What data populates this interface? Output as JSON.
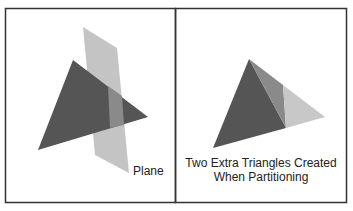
{
  "left_panel": {
    "label": "Plane",
    "shapes": {
      "triangle_color": "#555555",
      "plane_color": "#c4c4c4",
      "overlap_color": "#8a8a8a"
    }
  },
  "right_panel": {
    "label_line1": "Two Extra Triangles Created",
    "label_line2": "When Partitioning",
    "shapes": {
      "main_color": "#555555",
      "mid_color": "#8a8a8a",
      "light_color": "#c8c8c8"
    }
  },
  "frame_color": "#333333"
}
